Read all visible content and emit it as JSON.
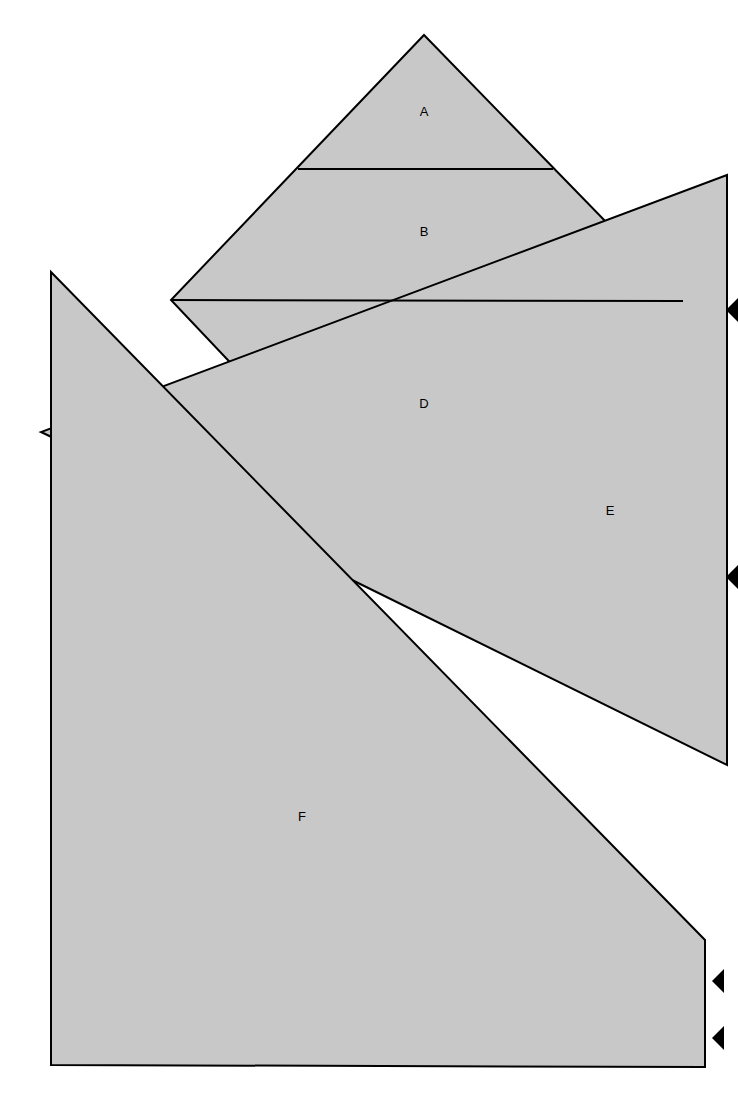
{
  "figure": {
    "kind": "overlapping-polygon-diagram",
    "canvas": {
      "width": 738,
      "height": 1120
    },
    "background_color": "#ffffff",
    "fill_color": "#c8c8c8",
    "stroke_color": "#000000",
    "stroke_width": 2,
    "labels": [
      {
        "id": "label-a",
        "text": "A",
        "x": 424,
        "y": 113
      },
      {
        "id": "label-b",
        "text": "B",
        "x": 424,
        "y": 233
      },
      {
        "id": "label-d",
        "text": "D",
        "x": 424,
        "y": 405
      },
      {
        "id": "label-e",
        "text": "E",
        "x": 610,
        "y": 512
      },
      {
        "id": "label-f",
        "text": "F",
        "x": 302,
        "y": 818
      }
    ],
    "shapes": [
      {
        "id": "shape-diamond-top",
        "name": "diamond-quadrilateral",
        "points": "424,35 683,301 424,567 171,300"
      },
      {
        "id": "shape-e-quad",
        "name": "right-large-quadrilateral",
        "points": "727,175 727,765 348,578 41,432"
      },
      {
        "id": "shape-f-quad",
        "name": "bottom-left-large-quadrilateral",
        "points": "51,272 705,940 705,1067 51,1065"
      }
    ],
    "divider_lines": [
      {
        "id": "divider-ab",
        "x1": 298,
        "y1": 169,
        "x2": 553,
        "y2": 169
      },
      {
        "id": "divider-bd",
        "x1": 171,
        "y1": 300,
        "x2": 683,
        "y2": 301
      }
    ],
    "markers": [
      {
        "id": "marker-1",
        "shape": "left-pointing-triangle",
        "x": 738,
        "y": 310,
        "size": 12
      },
      {
        "id": "marker-2",
        "shape": "left-pointing-triangle",
        "x": 738,
        "y": 577,
        "size": 12
      },
      {
        "id": "marker-3",
        "shape": "left-pointing-triangle",
        "x": 724,
        "y": 981,
        "size": 12
      },
      {
        "id": "marker-4",
        "shape": "left-pointing-triangle",
        "x": 724,
        "y": 1038,
        "size": 12
      }
    ]
  }
}
